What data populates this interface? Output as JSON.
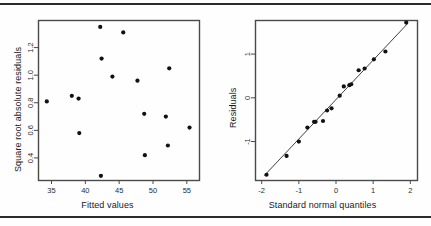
{
  "page": {
    "background_color": "#fefefe",
    "rule_color": "#2b2b2b",
    "top_rule_name": "top-horizontal-rule",
    "bottom_rule_name": "bottom-horizontal-rule"
  },
  "chart_data": [
    {
      "type": "scatter",
      "name": "scale-location-plot",
      "title": "",
      "xlabel": "Fitted values",
      "ylabel": "Square root absolute residuals",
      "xlim": [
        33.0,
        56.8
      ],
      "ylim": [
        0.24,
        1.4
      ],
      "xticks": [
        35,
        40,
        45,
        50,
        55
      ],
      "yticks": [
        0.4,
        0.6,
        0.8,
        1.0,
        1.2
      ],
      "grid": false,
      "legend": "none",
      "marker": "filled-circle",
      "marker_color": "#111111",
      "points": [
        {
          "x": 34.3,
          "y": 0.81
        },
        {
          "x": 38.0,
          "y": 0.85
        },
        {
          "x": 39.0,
          "y": 0.83
        },
        {
          "x": 39.1,
          "y": 0.58
        },
        {
          "x": 42.2,
          "y": 1.35
        },
        {
          "x": 42.3,
          "y": 0.27
        },
        {
          "x": 42.4,
          "y": 1.12
        },
        {
          "x": 44.0,
          "y": 0.99
        },
        {
          "x": 45.6,
          "y": 1.31
        },
        {
          "x": 47.7,
          "y": 0.96
        },
        {
          "x": 48.7,
          "y": 0.72
        },
        {
          "x": 48.8,
          "y": 0.42
        },
        {
          "x": 51.9,
          "y": 0.7
        },
        {
          "x": 52.2,
          "y": 0.49
        },
        {
          "x": 52.4,
          "y": 1.05
        },
        {
          "x": 55.4,
          "y": 0.62
        }
      ]
    },
    {
      "type": "scatter",
      "name": "normal-qq-plot",
      "title": "",
      "xlabel": "Standard normal quantiles",
      "ylabel": "Residuals",
      "xlim": [
        -2.18,
        2.18
      ],
      "ylim": [
        -1.88,
        1.78
      ],
      "xticks": [
        -2,
        -1,
        0,
        1,
        2
      ],
      "yticks": [
        -1,
        0,
        1
      ],
      "grid": false,
      "legend": "none",
      "marker": "filled-circle",
      "marker_color": "#111111",
      "reference_line": {
        "x0": -1.93,
        "y0": -1.78,
        "x1": 1.93,
        "y1": 1.7
      },
      "points": [
        {
          "x": -1.87,
          "y": -1.76
        },
        {
          "x": -1.33,
          "y": -1.33
        },
        {
          "x": -1.0,
          "y": -1.0
        },
        {
          "x": -0.77,
          "y": -0.68
        },
        {
          "x": -0.59,
          "y": -0.55
        },
        {
          "x": -0.55,
          "y": -0.55
        },
        {
          "x": -0.35,
          "y": -0.53
        },
        {
          "x": -0.24,
          "y": -0.29
        },
        {
          "x": -0.12,
          "y": -0.24
        },
        {
          "x": 0.1,
          "y": 0.05
        },
        {
          "x": 0.21,
          "y": 0.26
        },
        {
          "x": 0.36,
          "y": 0.29
        },
        {
          "x": 0.41,
          "y": 0.31
        },
        {
          "x": 0.61,
          "y": 0.63
        },
        {
          "x": 0.77,
          "y": 0.67
        },
        {
          "x": 1.02,
          "y": 0.88
        },
        {
          "x": 1.33,
          "y": 1.06
        },
        {
          "x": 1.89,
          "y": 1.72
        }
      ]
    }
  ]
}
